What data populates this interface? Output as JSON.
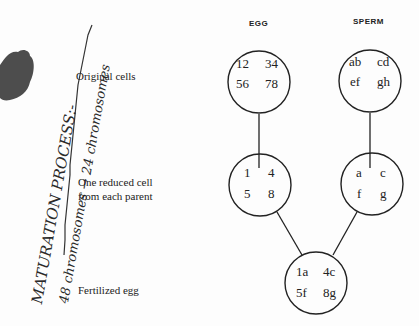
{
  "handwriting": {
    "line1": "MATURATION PROCESS:-",
    "line2": "48 chromosomes → 24 chromosomes"
  },
  "stage_labels": {
    "original": "Original cells",
    "reduced_line1": "One reduced cell",
    "reduced_line2": "from each parent",
    "fertilized": "Fertilized egg"
  },
  "columns": {
    "egg": "EGG",
    "sperm": "SPERM"
  },
  "cells": {
    "egg_original": [
      "12",
      "34",
      "56",
      "78"
    ],
    "sperm_original": [
      "ab",
      "cd",
      "ef",
      "gh"
    ],
    "egg_reduced": [
      "1",
      "4",
      "5",
      "8"
    ],
    "sperm_reduced": [
      "a",
      "c",
      "f",
      "g"
    ],
    "fertilized": [
      "1a",
      "4c",
      "5f",
      "8g"
    ]
  },
  "colors": {
    "ink": "#222222",
    "blot": "#3a3a3a",
    "paper": "#fdfdfd"
  }
}
